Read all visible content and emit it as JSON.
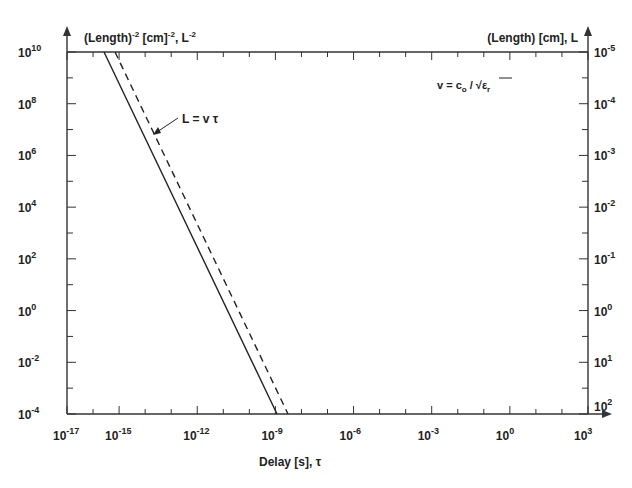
{
  "chart_data": {
    "type": "line",
    "title": "",
    "xlabel": "Delay [s], τ",
    "ylabel_left": "(Length)^-2 [cm]^-2, L^-2",
    "ylabel_right": "(Length) [cm], L",
    "xscale": "log",
    "yscale": "log",
    "xlim": [
      1e-17,
      1000.0
    ],
    "ylim_left": [
      0.0001,
      10000000000.0
    ],
    "ylim_right": [
      100.0,
      1e-05
    ],
    "grid": false,
    "x_tick_labels": [
      "10^-17",
      "10^-15",
      "10^-12",
      "10^-9",
      "10^-6",
      "10^-3",
      "10^0",
      "10^3"
    ],
    "y_left_tick_labels": [
      "10^10",
      "10^8",
      "10^6",
      "10^4",
      "10^2",
      "10^0",
      "10^-2",
      "10^-4"
    ],
    "y_right_tick_labels": [
      "10^-5",
      "10^-4",
      "10^-3",
      "10^-2",
      "10^-1",
      "10^0",
      "10^1",
      "10^2"
    ],
    "annotations": [
      "L = v τ",
      "v = c_o / √ε_r"
    ],
    "series": [
      {
        "name": "L = v τ (solid)",
        "style": "solid",
        "x": [
          2.5e-16,
          1.1e-09
        ],
        "y": [
          10000000000.0,
          0.0001
        ]
      },
      {
        "name": "L = v τ (dashed)",
        "style": "dashed",
        "x": [
          6e-16,
          2.9e-09
        ],
        "y": [
          10000000000.0,
          0.0001
        ]
      }
    ]
  },
  "labels": {
    "left_axis": "(Length)",
    "left_axis_sup1": "-2",
    "left_axis_mid": " [cm]",
    "left_axis_sup2": "-2",
    "left_axis_end": ", L",
    "left_axis_sup3": "-2",
    "right_axis": "(Length) [cm], L",
    "x_axis": "Delay [s], τ",
    "annotation_line": "L = v τ",
    "formula_v": "v = c",
    "formula_sub": "o",
    "formula_rest": " / √ε",
    "formula_sub2": "r"
  },
  "ticks": {
    "x": [
      {
        "base": "10",
        "exp": "-17"
      },
      {
        "base": "10",
        "exp": "-15"
      },
      {
        "base": "10",
        "exp": "-12"
      },
      {
        "base": "10",
        "exp": "-9"
      },
      {
        "base": "10",
        "exp": "-6"
      },
      {
        "base": "10",
        "exp": "-3"
      },
      {
        "base": "10",
        "exp": "0"
      },
      {
        "base": "10",
        "exp": "3"
      }
    ],
    "yl": [
      {
        "base": "10",
        "exp": "10"
      },
      {
        "base": "10",
        "exp": "8"
      },
      {
        "base": "10",
        "exp": "6"
      },
      {
        "base": "10",
        "exp": "4"
      },
      {
        "base": "10",
        "exp": "2"
      },
      {
        "base": "10",
        "exp": "0"
      },
      {
        "base": "10",
        "exp": "-2"
      },
      {
        "base": "10",
        "exp": "-4"
      }
    ],
    "yr": [
      {
        "base": "10",
        "exp": "-5"
      },
      {
        "base": "10",
        "exp": "-4"
      },
      {
        "base": "10",
        "exp": "-3"
      },
      {
        "base": "10",
        "exp": "-2"
      },
      {
        "base": "10",
        "exp": "-1"
      },
      {
        "base": "10",
        "exp": "0"
      },
      {
        "base": "10",
        "exp": "1"
      },
      {
        "base": "10",
        "exp": "2"
      }
    ]
  }
}
